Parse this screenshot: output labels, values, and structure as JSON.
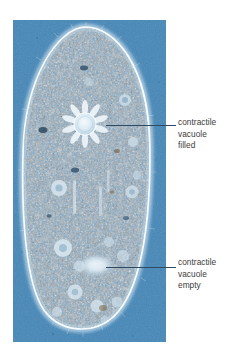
{
  "figure": {
    "kind": "light-micrograph",
    "width": 244,
    "height": 358
  },
  "photo": {
    "x": 13,
    "y": 20,
    "width": 153,
    "height": 322,
    "background_color": "#4d8cbb",
    "cytoplasm_color": "#7fa9c9",
    "membrane_color": "#eef5fa",
    "granule_dark_color": "#2c5878",
    "granule_light_color": "#cfe2ee"
  },
  "cell": {
    "center_x": 86,
    "top_y": 28,
    "bottom_y": 325,
    "half_width": 62
  },
  "organelles": {
    "vacuole_filled": {
      "center_x": 85,
      "center_y": 124,
      "radius": 11,
      "canal_count": 10,
      "canal_length": 17
    },
    "vacuole_empty": {
      "center_x": 97,
      "center_y": 266,
      "radius_x": 16,
      "radius_y": 10
    }
  },
  "annotations": [
    {
      "id": "filled",
      "text": "contractile\nvacuole\nfilled",
      "leader": {
        "x": 106,
        "y": 125,
        "length": 70
      },
      "label": {
        "x": 178,
        "y": 117
      }
    },
    {
      "id": "empty",
      "text": "contractile\nvacuole\nempty",
      "leader": {
        "x": 106,
        "y": 267,
        "length": 70
      },
      "label": {
        "x": 178,
        "y": 257
      }
    }
  ],
  "style": {
    "text_color": "#3b3b3b",
    "leader_color": "#2f4a63",
    "font_size_px": 8.3,
    "line_height_px": 11.6
  }
}
